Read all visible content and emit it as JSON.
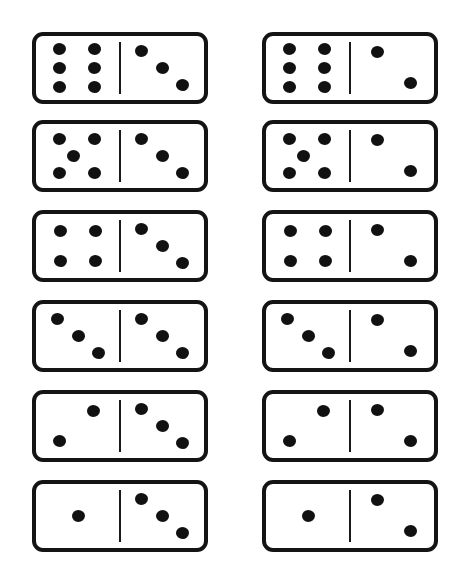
{
  "page": {
    "background_color": "#ffffff",
    "tile_border_color": "#141414",
    "pip_color": "#111111",
    "divider_color": "#1a1a1a",
    "width": 467,
    "height": 574,
    "columns": 2,
    "rows": 6,
    "total_tiles": 12
  },
  "layout": {
    "tile_width": 176,
    "tile_height": 72,
    "column_x": [
      32,
      262
    ],
    "row_y": [
      32,
      120,
      210,
      300,
      390,
      480
    ]
  },
  "pip_layouts": {
    "1": [
      [
        50,
        50
      ]
    ],
    "2_left": [
      [
        68,
        27
      ],
      [
        28,
        73
      ]
    ],
    "2_right": [
      [
        33,
        25
      ],
      [
        72,
        73
      ]
    ],
    "3_diagonal": [
      [
        26,
        23
      ],
      [
        50,
        50
      ],
      [
        74,
        76
      ]
    ],
    "4": [
      [
        29,
        26
      ],
      [
        71,
        26
      ],
      [
        29,
        74
      ],
      [
        71,
        74
      ]
    ],
    "5": [
      [
        28,
        24
      ],
      [
        70,
        24
      ],
      [
        45,
        50
      ],
      [
        28,
        76
      ],
      [
        70,
        76
      ]
    ],
    "6": [
      [
        28,
        21
      ],
      [
        70,
        21
      ],
      [
        28,
        50
      ],
      [
        70,
        50
      ],
      [
        28,
        79
      ],
      [
        70,
        79
      ]
    ]
  },
  "tiles": [
    {
      "id": "tile-1",
      "name": "domino-6-3",
      "row": 1,
      "column": "left",
      "left_value": 6,
      "right_value": 3,
      "total": 9,
      "left_layout": "6",
      "right_layout": "3_diagonal"
    },
    {
      "id": "tile-2",
      "name": "domino-6-2",
      "row": 1,
      "column": "right",
      "left_value": 6,
      "right_value": 2,
      "total": 8,
      "left_layout": "6",
      "right_layout": "2_right"
    },
    {
      "id": "tile-3",
      "name": "domino-5-3",
      "row": 2,
      "column": "left",
      "left_value": 5,
      "right_value": 3,
      "total": 8,
      "left_layout": "5",
      "right_layout": "3_diagonal"
    },
    {
      "id": "tile-4",
      "name": "domino-5-2",
      "row": 2,
      "column": "right",
      "left_value": 5,
      "right_value": 2,
      "total": 7,
      "left_layout": "5",
      "right_layout": "2_right"
    },
    {
      "id": "tile-5",
      "name": "domino-4-3",
      "row": 3,
      "column": "left",
      "left_value": 4,
      "right_value": 3,
      "total": 7,
      "left_layout": "4",
      "right_layout": "3_diagonal"
    },
    {
      "id": "tile-6",
      "name": "domino-4-2",
      "row": 3,
      "column": "right",
      "left_value": 4,
      "right_value": 2,
      "total": 6,
      "left_layout": "4",
      "right_layout": "2_right"
    },
    {
      "id": "tile-7",
      "name": "domino-3-3",
      "row": 4,
      "column": "left",
      "left_value": 3,
      "right_value": 3,
      "total": 6,
      "left_layout": "3_diagonal",
      "right_layout": "3_diagonal"
    },
    {
      "id": "tile-8",
      "name": "domino-3-2",
      "row": 4,
      "column": "right",
      "left_value": 3,
      "right_value": 2,
      "total": 5,
      "left_layout": "3_diagonal",
      "right_layout": "2_right"
    },
    {
      "id": "tile-9",
      "name": "domino-2-3",
      "row": 5,
      "column": "left",
      "left_value": 2,
      "right_value": 3,
      "total": 5,
      "left_layout": "2_left",
      "right_layout": "3_diagonal"
    },
    {
      "id": "tile-10",
      "name": "domino-2-2",
      "row": 5,
      "column": "right",
      "left_value": 2,
      "right_value": 2,
      "total": 4,
      "left_layout": "2_left",
      "right_layout": "2_right"
    },
    {
      "id": "tile-11",
      "name": "domino-1-3",
      "row": 6,
      "column": "left",
      "left_value": 1,
      "right_value": 3,
      "total": 4,
      "left_layout": "1",
      "right_layout": "3_diagonal"
    },
    {
      "id": "tile-12",
      "name": "domino-1-2",
      "row": 6,
      "column": "right",
      "left_value": 1,
      "right_value": 2,
      "total": 3,
      "left_layout": "1",
      "right_layout": "2_right"
    }
  ]
}
